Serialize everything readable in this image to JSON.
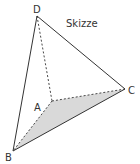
{
  "figure": {
    "title": "Skizze",
    "fill_color": "#d9d9d9",
    "line_color": "#333333",
    "vertices": {
      "A": {
        "label": "A",
        "x": 52,
        "y": 101
      },
      "B": {
        "label": "B",
        "x": 13,
        "y": 151
      },
      "C": {
        "label": "C",
        "x": 125,
        "y": 89
      },
      "D": {
        "label": "D",
        "x": 37,
        "y": 16
      }
    },
    "solid_edges": [
      "BD",
      "DC",
      "BC"
    ],
    "dashed_edges": [
      "DA",
      "AB",
      "AC"
    ],
    "shaded_face": "ABC"
  }
}
